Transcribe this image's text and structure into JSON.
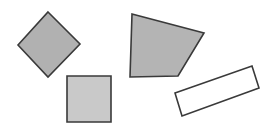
{
  "canvas": {
    "width": 271,
    "height": 132,
    "background": "#ffffff"
  },
  "stroke": {
    "color": "#3a3a3a",
    "width": 1.6
  },
  "shapes": [
    {
      "id": "diamond",
      "kind": "rotated-square",
      "fill": "#b1b1b1",
      "points": "48,12 80,44 48,77 18,45"
    },
    {
      "id": "square",
      "kind": "square",
      "fill": "#c9c9c9",
      "points": "67,76 111,76 111,122 67,122"
    },
    {
      "id": "quadrilateral",
      "kind": "irregular-quadrilateral",
      "fill": "#b4b4b4",
      "points": "132,14 204,33 178,76 130,77"
    },
    {
      "id": "rectangle",
      "kind": "rotated-rectangle",
      "fill": "#ffffff",
      "points": "175,93 252,66 259,88 182,116"
    }
  ]
}
